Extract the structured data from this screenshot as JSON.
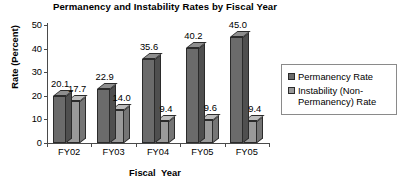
{
  "chart_data": {
    "type": "bar",
    "title": "Permanency and Instability Rates by Fiscal Year",
    "xlabel": "Fiscal  Year",
    "ylabel": "Rate (Percent)",
    "categories": [
      "FY02",
      "FY03",
      "FY04",
      "FY05",
      "FY05"
    ],
    "ylim": [
      0,
      50
    ],
    "yticks": [
      0,
      10,
      20,
      30,
      40,
      50
    ],
    "ytick_labels": [
      "0",
      "10",
      "20",
      "30",
      "40",
      "50"
    ],
    "grid": false,
    "legend_position": "right",
    "series": [
      {
        "name": "Permanency Rate",
        "color": "#6b6b6b",
        "side_color": "#4f4f4f",
        "top_color": "#8e8e8e",
        "values": [
          20.1,
          22.9,
          35.6,
          40.2,
          45.0
        ],
        "labels": [
          "20.1",
          "22.9",
          "35.6",
          "40.2",
          "45.0"
        ]
      },
      {
        "name": "Instability (Non-Permanency) Rate",
        "color": "#9a9a9a",
        "side_color": "#757575",
        "top_color": "#bdbdbd",
        "values": [
          17.7,
          14.0,
          9.4,
          9.6,
          9.4
        ],
        "labels": [
          "17.7",
          "14.0",
          "9.4",
          "9.6",
          "9.4"
        ]
      }
    ]
  },
  "legend": {
    "items": [
      {
        "label": "Permanency Rate"
      },
      {
        "label": "Instability (Non-Permanency) Rate"
      }
    ]
  }
}
